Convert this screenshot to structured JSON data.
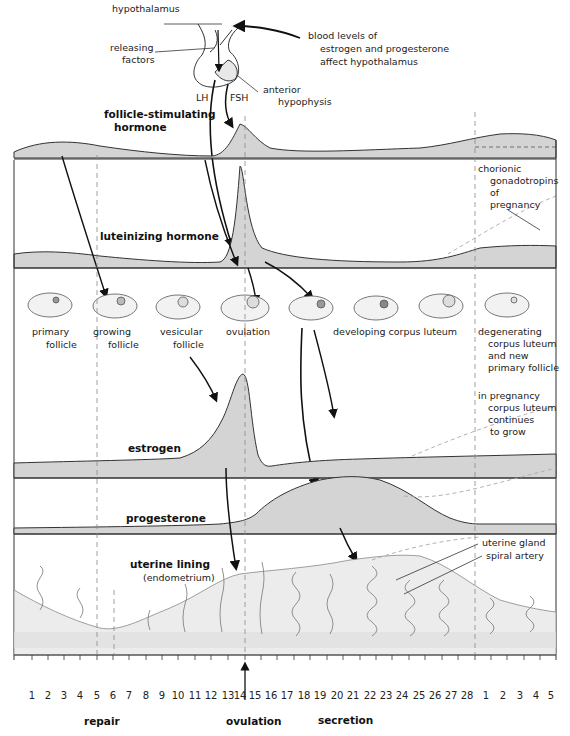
{
  "pituitary": {
    "hypothalamus": "hypothalamus",
    "releasing_factors_line1": "releasing",
    "releasing_factors_line2": "factors",
    "feedback_line1": "blood levels of",
    "feedback_line2": "estrogen and progesterone",
    "feedback_line3": "affect hypothalamus",
    "anterior_line1": "anterior",
    "anterior_line2": "hypophysis",
    "lh": "LH",
    "fsh": "FSH"
  },
  "bands": {
    "fsh_line1": "follicle-stimulating",
    "fsh_line2": "hormone",
    "lh": "luteinizing hormone",
    "chorionic_line1": "chorionic",
    "chorionic_line2": "gonadotropins",
    "chorionic_line3": "of",
    "chorionic_line4": "pregnancy",
    "estrogen": "estrogen",
    "progesterone": "progesterone",
    "pregnancy_line1": "in pregnancy",
    "pregnancy_line2": "corpus luteum",
    "pregnancy_line3": "continues",
    "pregnancy_line4": "to grow",
    "uterine_line1": "uterine lining",
    "uterine_line2": "(endometrium)",
    "uterine_gland": "uterine gland",
    "spiral_artery": "spiral artery"
  },
  "follicles": [
    {
      "line1": "primary",
      "line2": "follicle"
    },
    {
      "line1": "growing",
      "line2": "follicle"
    },
    {
      "line1": "vesicular",
      "line2": "follicle"
    },
    {
      "line1": "ovulation",
      "line2": ""
    },
    {
      "line1": "developing corpus luteum",
      "line2": ""
    },
    {
      "line1": "degenerating",
      "line2": "corpus luteum",
      "line3": "and new",
      "line4": "primary follicle"
    }
  ],
  "days": [
    "1",
    "2",
    "3",
    "4",
    "5",
    "6",
    "7",
    "8",
    "9",
    "10",
    "11",
    "12",
    "13",
    "14",
    "15",
    "16",
    "17",
    "18",
    "19",
    "20",
    "21",
    "22",
    "23",
    "24",
    "25",
    "26",
    "27",
    "28",
    "1",
    "2",
    "3",
    "4",
    "5"
  ],
  "phases": {
    "repair": "repair",
    "ovulation": "ovulation",
    "secretion": "secretion",
    "menstruation_start": "menstruation",
    "proliferation": "proliferation",
    "menstruation_end": "menstruation"
  },
  "colors": {
    "fill": "#d4d4d4",
    "stroke": "#333333",
    "dash": "#888888"
  }
}
